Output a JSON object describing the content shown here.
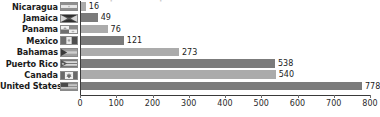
{
  "chart_data": {
    "type": "bar",
    "orientation": "horizontal",
    "title": "public transportation — 2007 total",
    "xlabel": "",
    "ylabel": "",
    "xlim": [
      0,
      800
    ],
    "xticks": [
      0,
      100,
      200,
      300,
      400,
      500,
      600,
      700,
      800
    ],
    "grid": false,
    "legend": "none",
    "categories": [
      "Nicaragua",
      "Jamaica",
      "Panama",
      "Mexico",
      "Bahamas",
      "Puerto Rico",
      "Canada",
      "United States"
    ],
    "values": [
      16,
      49,
      76,
      121,
      273,
      538,
      540,
      778
    ],
    "bar_shades": [
      "light",
      "dark",
      "light",
      "dark",
      "light",
      "dark",
      "light",
      "dark"
    ],
    "colors": {
      "bar_dark": "#7b7b7b",
      "bar_light": "#ababab",
      "axis": "#3a3a3a",
      "text": "#1b1b1b",
      "background": "#ffffff"
    }
  },
  "rows": [
    {
      "label": "Nicaragua",
      "value": 16,
      "value_text": "16",
      "shade": "light",
      "flag": "flag-nicaragua"
    },
    {
      "label": "Jamaica",
      "value": 49,
      "value_text": "49",
      "shade": "dark",
      "flag": "flag-jamaica"
    },
    {
      "label": "Panama",
      "value": 76,
      "value_text": "76",
      "shade": "light",
      "flag": "flag-panama"
    },
    {
      "label": "Mexico",
      "value": 121,
      "value_text": "121",
      "shade": "dark",
      "flag": "flag-mexico"
    },
    {
      "label": "Bahamas",
      "value": 273,
      "value_text": "273",
      "shade": "light",
      "flag": "flag-bahamas"
    },
    {
      "label": "Puerto Rico",
      "value": 538,
      "value_text": "538",
      "shade": "dark",
      "flag": "flag-puerto-rico"
    },
    {
      "label": "Canada",
      "value": 540,
      "value_text": "540",
      "shade": "light",
      "flag": "flag-canada"
    },
    {
      "label": "United States",
      "value": 778,
      "value_text": "778",
      "shade": "dark",
      "flag": "flag-united-states"
    }
  ],
  "axis": {
    "ticks": [
      "0",
      "100",
      "200",
      "300",
      "400",
      "500",
      "600",
      "700",
      "800"
    ]
  }
}
